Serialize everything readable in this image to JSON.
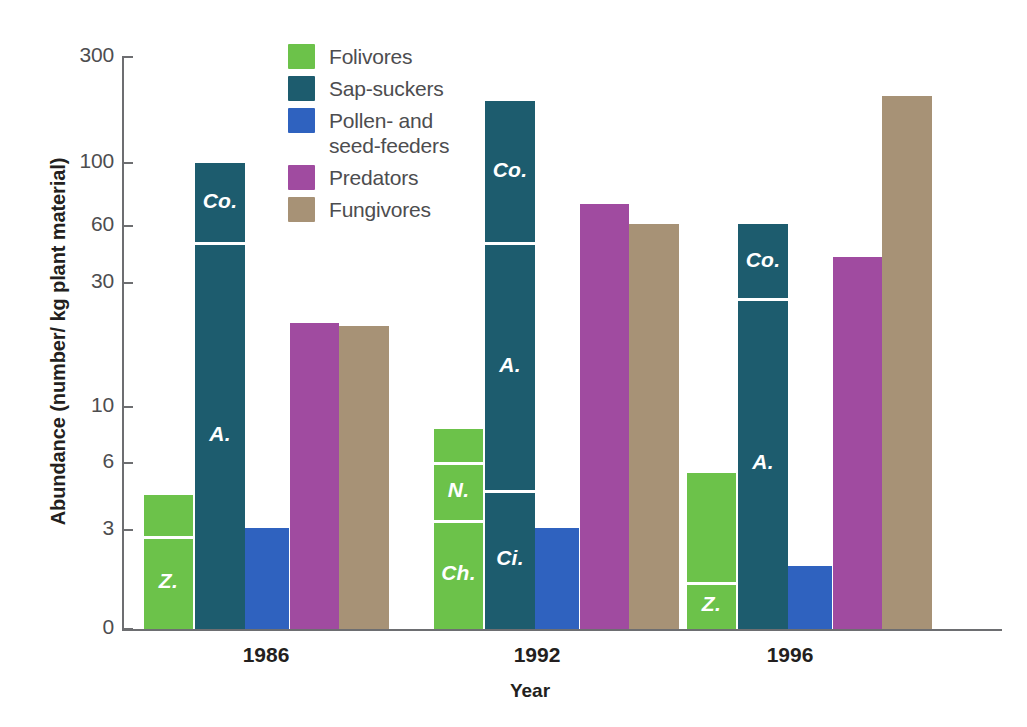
{
  "chart_data": {
    "type": "bar",
    "title": "",
    "xlabel": "Year",
    "ylabel": "Abundance (number/ kg plant material)",
    "yscale": "log-like-custom",
    "yticks": [
      0,
      3,
      6,
      10,
      30,
      60,
      100,
      300
    ],
    "ytick_labels": [
      "0",
      "3",
      "6",
      "10",
      "30",
      "60",
      "100",
      "300"
    ],
    "ylim": [
      0,
      300
    ],
    "grid": false,
    "legend_position": "top-center",
    "categories": [
      "1986",
      "1992",
      "1996"
    ],
    "legend": [
      {
        "label": "Folivores",
        "color": "#6cc24a"
      },
      {
        "label": "Sap-suckers",
        "color": "#1d5c6e"
      },
      {
        "label": "Pollen- and\nseed-feeders",
        "color": "#2f62bf"
      },
      {
        "label": "Predators",
        "color": "#a04ba0"
      },
      {
        "label": "Fungivores",
        "color": "#a79276"
      }
    ],
    "series": [
      {
        "name": "Folivores",
        "color": "#6cc24a",
        "values": [
          4.3,
          8.2,
          5.4
        ],
        "segments": [
          [
            {
              "label": "Z.",
              "value": 2.8
            },
            {
              "label": "",
              "value": 4.3
            }
          ],
          [
            {
              "label": "Ch.",
              "value": 3.3
            },
            {
              "label": "N.",
              "value": 6.0
            },
            {
              "label": "",
              "value": 8.2
            }
          ],
          [
            {
              "label": "Z.",
              "value": 1.4
            },
            {
              "label": "",
              "value": 5.4
            }
          ]
        ]
      },
      {
        "name": "Sap-suckers",
        "color": "#1d5c6e",
        "values": [
          100,
          190,
          61
        ],
        "segments": [
          [
            {
              "label": "A.",
              "value": 49
            },
            {
              "label": "Co.",
              "value": 100
            }
          ],
          [
            {
              "label": "Ci.",
              "value": 4.5
            },
            {
              "label": "A.",
              "value": 49
            },
            {
              "label": "Co.",
              "value": 190
            }
          ],
          [
            {
              "label": "A.",
              "value": 26
            },
            {
              "label": "Co.",
              "value": 61
            }
          ]
        ]
      },
      {
        "name": "Pollen- and seed-feeders",
        "color": "#2f62bf",
        "values": [
          3.05,
          3.05,
          1.9
        ],
        "segments": [
          [],
          [],
          []
        ]
      },
      {
        "name": "Predators",
        "color": "#a04ba0",
        "values": [
          21,
          72,
          41
        ],
        "segments": [
          [],
          [],
          []
        ]
      },
      {
        "name": "Fungivores",
        "color": "#a79276",
        "values": [
          20.5,
          61,
          200
        ],
        "segments": [
          [],
          [],
          []
        ]
      }
    ]
  },
  "axis": {
    "y_title": "Abundance (number/ kg plant material)",
    "x_title": "Year",
    "tick_0": "0",
    "tick_3": "3",
    "tick_6": "6",
    "tick_10": "10",
    "tick_30": "30",
    "tick_60": "60",
    "tick_100": "100",
    "tick_300": "300"
  },
  "groups": {
    "g0": "1986",
    "g1": "1992",
    "g2": "1996"
  },
  "legend": {
    "item0": "Folivores",
    "item1": "Sap-suckers",
    "item2": "Pollen- and\nseed-feeders",
    "item3": "Predators",
    "item4": "Fungivores"
  }
}
